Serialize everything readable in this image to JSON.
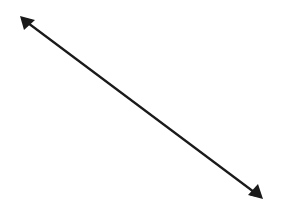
{
  "diagram": {
    "type": "double-headed-arrow",
    "line_color": "#1a1a1a",
    "background_color": "#ffffff",
    "arrowheads": [
      "start",
      "end"
    ]
  }
}
